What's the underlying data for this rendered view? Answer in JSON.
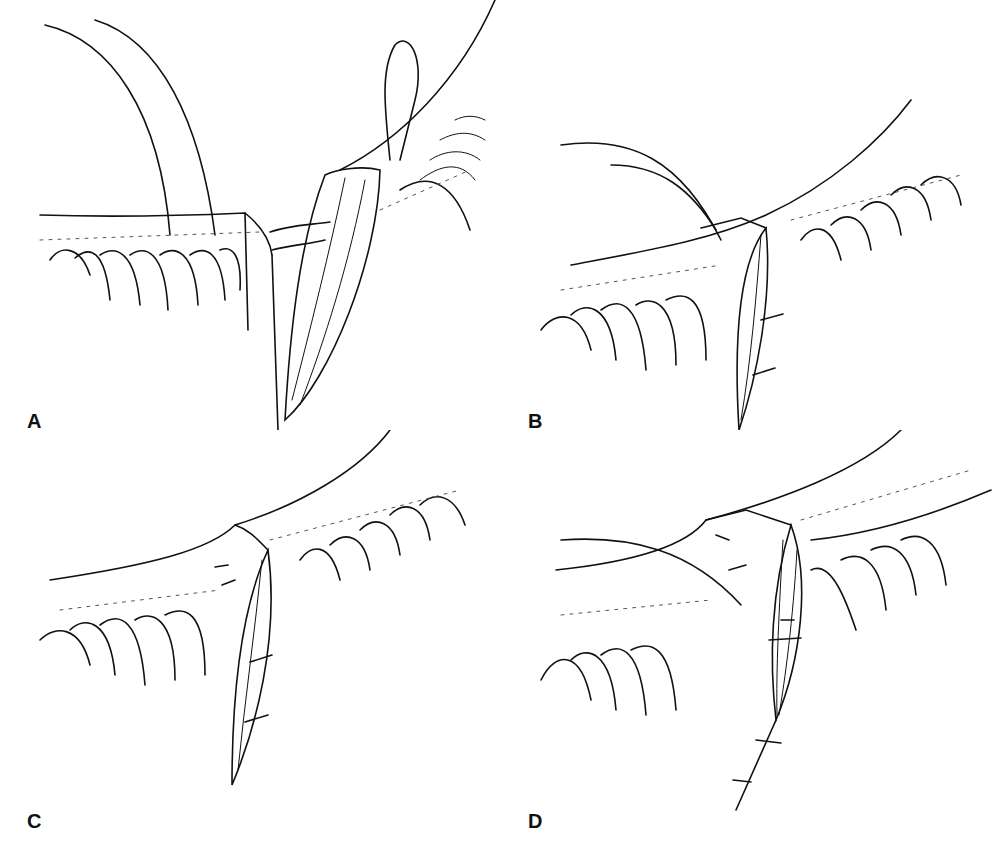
{
  "figure": {
    "panels": [
      {
        "id": "A",
        "label": "A",
        "description": "Everted lid margin with tarsal plate strip and sutures"
      },
      {
        "id": "B",
        "label": "B",
        "description": "Wedge closure with two interrupted sutures"
      },
      {
        "id": "C",
        "label": "C",
        "description": "Margin sutures placed, wedge closed"
      },
      {
        "id": "D",
        "label": "D",
        "description": "Skin closure with running suture extending inferiorly"
      }
    ],
    "colors": {
      "ink": "#111111",
      "background": "#ffffff"
    }
  }
}
